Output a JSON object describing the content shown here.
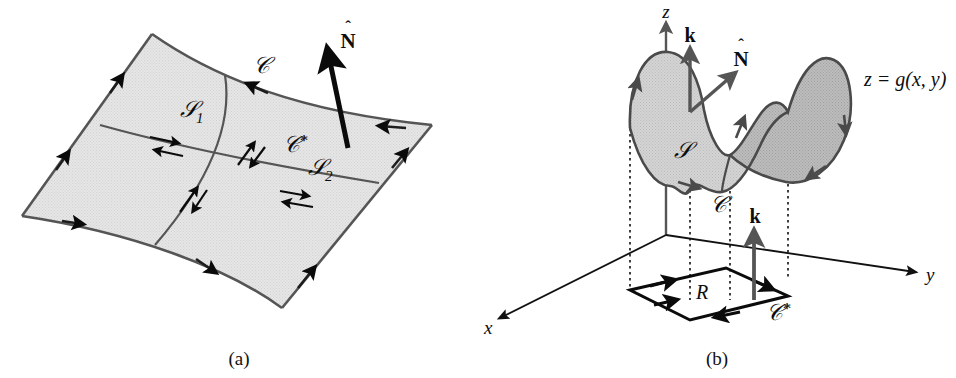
{
  "figure": {
    "type": "math-diagram",
    "panels": [
      {
        "caption": "(a)",
        "labels": {
          "curve_boundary": "ᶜ",
          "curve_interior": "ᶜ*",
          "surface_1": "S",
          "surface_1_sub": "1",
          "surface_2": "S",
          "surface_2_sub": "2",
          "normal": "N"
        }
      },
      {
        "caption": "(b)",
        "labels": {
          "axis_x": "x",
          "axis_y": "y",
          "axis_z": "z",
          "surface": "S",
          "surface_equation": "z = g(x, y)",
          "curve_boundary": "ᶜ",
          "curve_projection": "ᶜ*",
          "region": "R",
          "normal": "N",
          "k_upper": "k",
          "k_lower": "k"
        }
      }
    ]
  },
  "captions": {
    "a": "(a)",
    "b": "(b)"
  },
  "panel_a": {
    "label_c": "𝒞",
    "label_c_star_base": "𝒞",
    "label_c_star_mark": "*",
    "label_s1_base": "𝒮",
    "label_s1_sub": "1",
    "label_s2_base": "𝒮",
    "label_s2_sub": "2",
    "label_n_hat": "N",
    "label_n_accent": "ˆ"
  },
  "panel_b": {
    "label_z": "z",
    "label_y": "y",
    "label_x": "x",
    "label_s": "𝒮",
    "label_c": "𝒞",
    "label_c_star_base": "𝒞",
    "label_c_star_mark": "*",
    "label_r": "R",
    "label_k_upper": "k",
    "label_k_lower": "k",
    "label_n_hat": "N",
    "label_n_accent": "ˆ",
    "label_surface_eq": "z = g(x, y)"
  },
  "colors": {
    "surface_fill_a": "#e2e2e2",
    "surface_fill_b_light": "#cfcfcf",
    "surface_fill_b_dark": "#b4b4b4",
    "outline": "#4a4a4a",
    "axis": "#1a1a1a",
    "vector_dark": "#0b0b0b",
    "vector_gray": "#555555",
    "text": "#0d0d0d",
    "background": "#ffffff"
  }
}
